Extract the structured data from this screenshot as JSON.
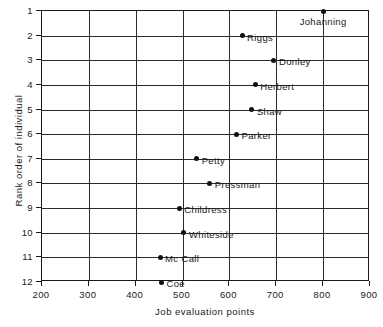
{
  "chart_data": {
    "type": "scatter",
    "title": "",
    "xlabel": "Job evaluation points",
    "ylabel": "Rank order of individual",
    "xlim": [
      200,
      900
    ],
    "ylim": [
      1,
      12
    ],
    "y_inverted": true,
    "grid": true,
    "legend": null,
    "xticks": [
      200,
      300,
      400,
      500,
      600,
      700,
      800,
      900
    ],
    "yticks": [
      1,
      2,
      3,
      4,
      5,
      6,
      7,
      8,
      9,
      10,
      11,
      12
    ],
    "xtick_labels": [
      "200",
      "300",
      "400",
      "500",
      "600",
      "700",
      "800",
      "900"
    ],
    "ytick_labels": [
      "1",
      "2",
      "3",
      "4",
      "5",
      "6",
      "7",
      "8",
      "9",
      "10",
      "11",
      "12"
    ],
    "marker_color": "#111111",
    "points": [
      {
        "label": "Johanning",
        "x": 800,
        "y": 1,
        "label_pos": "below"
      },
      {
        "label": "Riggs",
        "x": 627,
        "y": 2,
        "label_pos": "right"
      },
      {
        "label": "Donley",
        "x": 695,
        "y": 3,
        "label_pos": "right"
      },
      {
        "label": "Herbert",
        "x": 655,
        "y": 4,
        "label_pos": "right"
      },
      {
        "label": "Shaw",
        "x": 648,
        "y": 5,
        "label_pos": "right"
      },
      {
        "label": "Parker",
        "x": 615,
        "y": 6,
        "label_pos": "right"
      },
      {
        "label": "Petty",
        "x": 530,
        "y": 7,
        "label_pos": "right"
      },
      {
        "label": "Pressman",
        "x": 558,
        "y": 8,
        "label_pos": "right"
      },
      {
        "label": "Childress",
        "x": 493,
        "y": 9,
        "label_pos": "right"
      },
      {
        "label": "Whiteside",
        "x": 503,
        "y": 10,
        "label_pos": "right"
      },
      {
        "label": "Mc Call",
        "x": 452,
        "y": 11,
        "label_pos": "right"
      },
      {
        "label": "Coe",
        "x": 455,
        "y": 12,
        "label_pos": "right"
      }
    ]
  }
}
